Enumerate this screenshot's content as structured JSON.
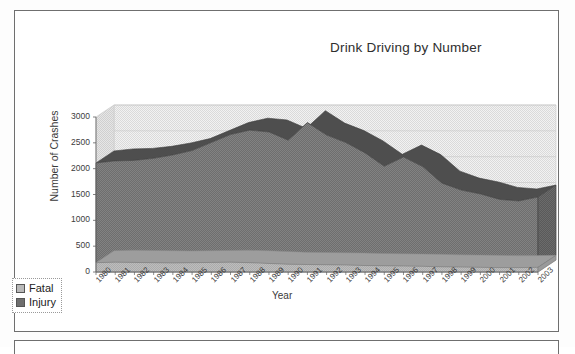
{
  "chart_data": {
    "type": "area",
    "title": "Drink Driving by Number",
    "xlabel": "Year",
    "ylabel": "Number of Crashes",
    "ylim": [
      0,
      3000
    ],
    "yticks": [
      "0",
      "500",
      "1000",
      "1500",
      "2000",
      "2500",
      "3000"
    ],
    "grid": true,
    "stacked": true,
    "legend_position": "bottom-left",
    "categories": [
      "1980",
      "1981",
      "1982",
      "1983",
      "1984",
      "1985",
      "1986",
      "1987",
      "1988",
      "1989",
      "1990",
      "1991",
      "1992",
      "1993",
      "1994",
      "1995",
      "1996",
      "1997",
      "1998",
      "1999",
      "2000",
      "2001",
      "2002",
      "2003"
    ],
    "series": [
      {
        "name": "Fatal",
        "color": "#b9b9b9",
        "values": [
          180,
          190,
          185,
          180,
          175,
          180,
          185,
          190,
          180,
          165,
          150,
          145,
          140,
          135,
          125,
          120,
          115,
          110,
          100,
          95,
          90,
          85,
          85,
          90
        ]
      },
      {
        "name": "Injury",
        "color": "#6e6e6e",
        "values": [
          1930,
          1960,
          1975,
          2020,
          2090,
          2170,
          2320,
          2470,
          2565,
          2545,
          2400,
          2745,
          2510,
          2370,
          2180,
          1925,
          2110,
          1930,
          1620,
          1490,
          1420,
          1320,
          1290,
          1360
        ]
      }
    ],
    "totals": [
      2110,
      2150,
      2160,
      2200,
      2265,
      2350,
      2505,
      2660,
      2745,
      2710,
      2550,
      2890,
      2650,
      2505,
      2305,
      2045,
      2225,
      2040,
      1720,
      1585,
      1510,
      1405,
      1375,
      1450
    ]
  },
  "legend": {
    "items": [
      {
        "label": "Fatal",
        "swatch": "fatal-swatch"
      },
      {
        "label": "Injury",
        "swatch": "injury-swatch"
      }
    ]
  }
}
